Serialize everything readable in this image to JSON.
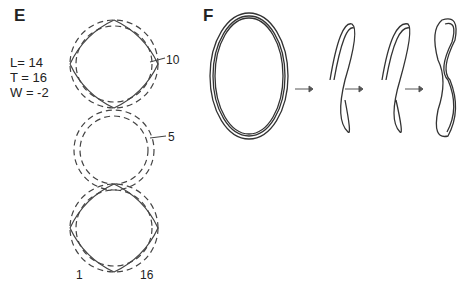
{
  "panel_e": {
    "label": "E",
    "params": [
      "L= 14",
      "T = 16",
      "W = -2"
    ],
    "markers": {
      "ten": "10",
      "five": "5",
      "one": "1",
      "sixteen": "16"
    }
  },
  "panel_f": {
    "label": "F",
    "arrows": [
      "→",
      "→",
      "→"
    ]
  }
}
